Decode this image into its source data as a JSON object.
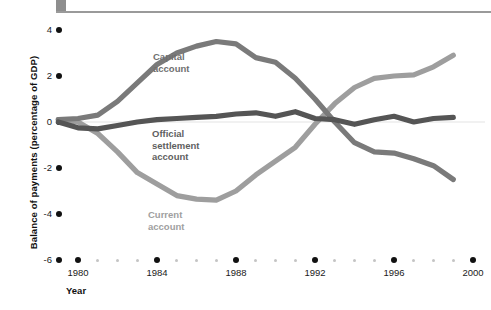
{
  "chart_data": {
    "type": "line",
    "title": "",
    "xlabel": "Year",
    "ylabel": "Balance of payments (percentage of GDP)",
    "xlim": [
      1979,
      2000
    ],
    "ylim": [
      -6,
      4
    ],
    "yticks": [
      4,
      2,
      0,
      -2,
      -4,
      -6
    ],
    "ytick_labels": [
      "4",
      "2",
      "0",
      "-2",
      "-4",
      "-6"
    ],
    "xticks": [
      1980,
      1984,
      1988,
      1992,
      1996,
      2000
    ],
    "xtick_labels": [
      "1980",
      "1984",
      "1988",
      "1992",
      "1996",
      "2000"
    ],
    "x_minor_ticks": [
      1981,
      1982,
      1983,
      1985,
      1986,
      1987,
      1989,
      1990,
      1991,
      1993,
      1994,
      1995,
      1997,
      1998,
      1999
    ],
    "grid": false,
    "legend_position": "inline-annotations",
    "x": [
      1979,
      1980,
      1981,
      1982,
      1983,
      1984,
      1985,
      1986,
      1987,
      1988,
      1989,
      1990,
      1991,
      1992,
      1993,
      1994,
      1995,
      1996,
      1997,
      1998,
      1999
    ],
    "series": [
      {
        "name": "Capital account",
        "label": "Capital\naccount",
        "color": "#7a7a7a",
        "values": [
          0.1,
          0.15,
          0.3,
          0.9,
          1.7,
          2.5,
          3.0,
          3.3,
          3.5,
          3.4,
          2.8,
          2.6,
          1.9,
          1.0,
          0.0,
          -0.9,
          -1.3,
          -1.35,
          -1.6,
          -1.9,
          -2.5
        ]
      },
      {
        "name": "Official settlement account",
        "label": "Official\nsettlement\naccount",
        "color": "#555555",
        "values": [
          0.0,
          -0.25,
          -0.3,
          -0.15,
          0.0,
          0.1,
          0.15,
          0.2,
          0.25,
          0.35,
          0.4,
          0.25,
          0.45,
          0.15,
          0.1,
          -0.1,
          0.1,
          0.25,
          0.0,
          0.15,
          0.2
        ]
      },
      {
        "name": "Current account",
        "label": "Current\naccount",
        "color": "#9e9e9e",
        "values": [
          0.1,
          0.0,
          -0.5,
          -1.3,
          -2.2,
          -2.7,
          -3.2,
          -3.35,
          -3.4,
          -3.0,
          -2.3,
          -1.7,
          -1.1,
          -0.1,
          0.8,
          1.5,
          1.9,
          2.0,
          2.05,
          2.4,
          2.9
        ]
      }
    ],
    "annotations": [
      {
        "text": "Capital account",
        "near_series": "Capital account"
      },
      {
        "text": "Official settlement account",
        "near_series": "Official settlement account"
      },
      {
        "text": "Current account",
        "near_series": "Current account"
      }
    ]
  },
  "axis": {
    "y_title": "Balance of payments (percentage of GDP)",
    "x_title": "Year",
    "y_labels": [
      "4",
      "2",
      "0",
      "-2",
      "-4",
      "-6"
    ],
    "x_labels": [
      "1980",
      "1984",
      "1988",
      "1992",
      "1996",
      "2000"
    ]
  },
  "labels": {
    "capital_line1": "Capital",
    "capital_line2": "account",
    "official_line1": "Official",
    "official_line2": "settlement",
    "official_line3": "account",
    "current_line1": "Current",
    "current_line2": "account"
  },
  "colors": {
    "capital": "#7a7a7a",
    "official": "#555555",
    "current": "#9e9e9e",
    "tick_major": "#111111",
    "tick_minor": "#c4c4c4",
    "rule": "#9a9a9a",
    "rule_block": "#8e8e8e"
  }
}
